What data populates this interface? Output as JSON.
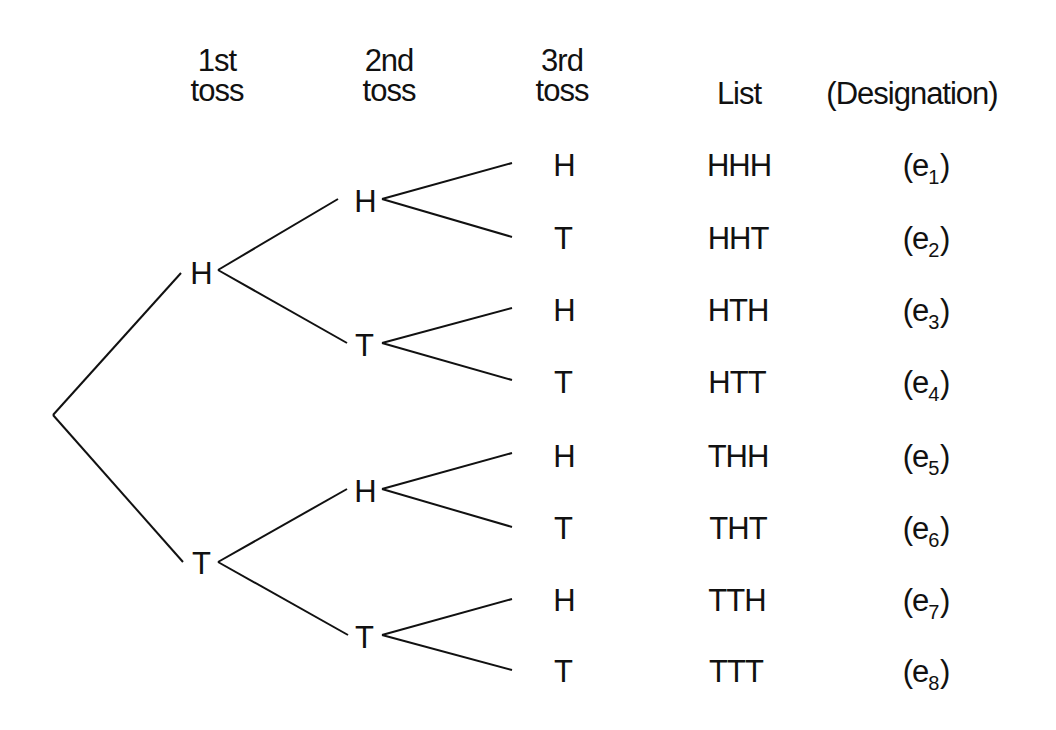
{
  "headers": {
    "toss1": [
      "1st",
      "toss"
    ],
    "toss2": [
      "2nd",
      "toss"
    ],
    "toss3": [
      "3rd",
      "toss"
    ],
    "list": "List",
    "designation": "(Designation)"
  },
  "tree": {
    "level1": [
      "H",
      "T"
    ],
    "level2": [
      "H",
      "T",
      "H",
      "T"
    ],
    "level3": [
      "H",
      "T",
      "H",
      "T",
      "H",
      "T",
      "H",
      "T"
    ]
  },
  "outcomes": [
    {
      "list": "HHH",
      "designation": "e",
      "index": "1"
    },
    {
      "list": "HHT",
      "designation": "e",
      "index": "2"
    },
    {
      "list": "HTH",
      "designation": "e",
      "index": "3"
    },
    {
      "list": "HTT",
      "designation": "e",
      "index": "4"
    },
    {
      "list": "THH",
      "designation": "e",
      "index": "5"
    },
    {
      "list": "THT",
      "designation": "e",
      "index": "6"
    },
    {
      "list": "TTH",
      "designation": "e",
      "index": "7"
    },
    {
      "list": "TTT",
      "designation": "e",
      "index": "8"
    }
  ],
  "colors": {
    "line": "#111111",
    "background": "#ffffff"
  }
}
